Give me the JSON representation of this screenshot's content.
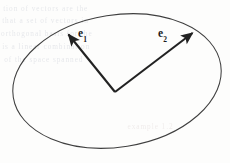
{
  "figure": {
    "caption_present": false,
    "background_color": "#fdfdfc",
    "ink_color": "#222222",
    "ellipse": {
      "center_x": 117,
      "center_y": 81,
      "radius_x": 105,
      "radius_y": 66,
      "rotation_deg": -9,
      "stroke_width": 1.0,
      "stroke_color": "#3a3a3a"
    },
    "vectors": [
      {
        "name": "e1",
        "label_text": "e",
        "label_subscript": "1",
        "origin_x": 115,
        "origin_y": 92,
        "tip_x": 65,
        "tip_y": 30,
        "label_x": 78,
        "label_y": 28,
        "stroke_width": 2.1,
        "arrowhead": "solid-triangle"
      },
      {
        "name": "e2",
        "label_text": "e",
        "label_subscript": "2",
        "origin_x": 115,
        "origin_y": 92,
        "tip_x": 196,
        "tip_y": 29,
        "label_x": 158,
        "label_y": 28,
        "stroke_width": 2.1,
        "arrowhead": "solid-triangle"
      }
    ]
  },
  "ghost_text": {
    "description": "faint show-through text from reverse page, illegible",
    "lines": [
      {
        "text": "tion  of      vectors      are    the",
        "x": 4,
        "y": 6,
        "warm": false
      },
      {
        "text": "that     a  set   of   vectors    in",
        "x": 3,
        "y": 18,
        "warm": false
      },
      {
        "text": "orthogonal   basis    for     the",
        "x": 2,
        "y": 31,
        "warm": false
      },
      {
        "text": "is  a   linear   combination",
        "x": 3,
        "y": 44,
        "warm": false
      },
      {
        "text": "of  the    space    spanned",
        "x": 5,
        "y": 57,
        "warm": false
      },
      {
        "text": "example   1.2",
        "x": 128,
        "y": 124,
        "warm": true
      }
    ]
  }
}
